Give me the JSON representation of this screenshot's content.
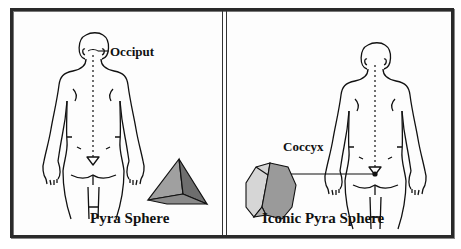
{
  "panels": [
    {
      "id": "left",
      "caption": "Pyra Sphere",
      "annotation": "Occiput",
      "shape": "tetrahedron-icon"
    },
    {
      "id": "right",
      "caption": "Iconic Pyra Sphere",
      "annotation": "Coccyx",
      "shape": "polyhedron-icon"
    }
  ],
  "colors": {
    "frame": "#2a2a2a",
    "outline": "#111111",
    "shape_light": "#b8b8b8",
    "shape_mid": "#8e8e8e",
    "shape_dark": "#6a6a6a"
  }
}
